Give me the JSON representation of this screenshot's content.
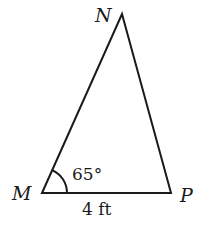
{
  "diagram": {
    "type": "triangle",
    "vertices": [
      {
        "name": "M",
        "x": 42,
        "y": 193
      },
      {
        "name": "N",
        "x": 122,
        "y": 14
      },
      {
        "name": "P",
        "x": 171,
        "y": 193
      }
    ],
    "labels": {
      "vertex_m": "M",
      "vertex_n": "N",
      "vertex_p": "P",
      "angle_m": "65°",
      "side_mp": "4 ft"
    },
    "angle_marks": [
      {
        "at": "M",
        "value": "65°"
      }
    ],
    "side_lengths": [
      {
        "side": "MP",
        "value": "4 ft"
      }
    ],
    "stroke_color": "#1a1a1a",
    "background": "#ffffff"
  }
}
